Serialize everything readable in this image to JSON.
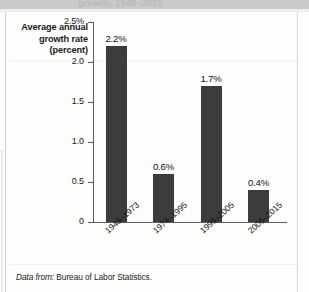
{
  "figure": {
    "cut_off_title": "growth, 1948–2015",
    "axis_title_lines": [
      "Average annual",
      "growth rate",
      "(percent)"
    ],
    "source_lead": "Data from:",
    "source_text": "Bureau of Labor Statistics.",
    "bar_color": "#3c3c3c",
    "axis_color": "#5d5d5d",
    "background": "#fdfdfc"
  },
  "chart_data": {
    "type": "bar",
    "title": "",
    "xlabel": "",
    "ylabel": "Average annual growth rate (percent)",
    "categories": [
      "1948–1973",
      "1974–1995",
      "1996–2005",
      "2006–2015"
    ],
    "values": [
      2.2,
      0.6,
      1.7,
      0.4
    ],
    "value_labels": [
      "2.2%",
      "0.6%",
      "1.7%",
      "0.4%"
    ],
    "ylim": [
      0,
      2.5
    ],
    "yticks": [
      0,
      0.5,
      1.0,
      1.5,
      2.0,
      2.5
    ],
    "ytick_labels": [
      "0",
      "0.5",
      "1.0",
      "1.5",
      "2.0",
      "2.5%"
    ],
    "grid": false,
    "legend": null
  }
}
